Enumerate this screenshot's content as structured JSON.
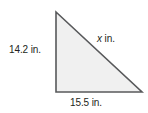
{
  "figure": {
    "name": "right-triangle-diagram",
    "background_color": "#ffffff",
    "shape": {
      "type": "right-triangle",
      "fill_color": "#f0f0f0",
      "stroke_color": "#58595b",
      "stroke_width": 1.6,
      "vertices": {
        "top_left": [
          56,
          12
        ],
        "bottom_left": [
          56,
          92
        ],
        "bottom_right": [
          142,
          92
        ]
      },
      "right_angle_at": "bottom_left"
    },
    "labels": {
      "left_leg": "14.2 in.",
      "bottom_leg": "15.5 in.",
      "hypotenuse_variable": "x",
      "hypotenuse_unit": "in.",
      "text_color": "#231f20"
    }
  }
}
